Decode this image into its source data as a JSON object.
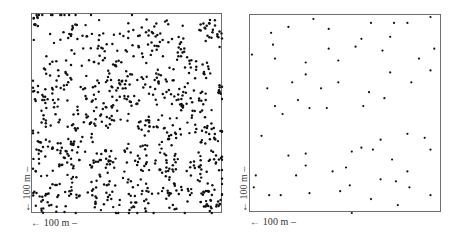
{
  "chart_data": [
    {
      "type": "scatter",
      "title": "",
      "description": "Clustered (aggregated) spatial point pattern in a 100 m x 100 m plot",
      "xlabel": "← 100 m –",
      "ylabel": "← 100 m –",
      "xlim": [
        0,
        100
      ],
      "ylim": [
        0,
        100
      ],
      "grid": false,
      "approx_point_count": 900,
      "clusters": [
        {
          "x": 3,
          "y": 97,
          "r": 4,
          "n": 8
        },
        {
          "x": 22,
          "y": 90,
          "r": 7,
          "n": 12
        },
        {
          "x": 40,
          "y": 78,
          "r": 8,
          "n": 18
        },
        {
          "x": 60,
          "y": 88,
          "r": 10,
          "n": 30
        },
        {
          "x": 76,
          "y": 84,
          "r": 6,
          "n": 14
        },
        {
          "x": 93,
          "y": 92,
          "r": 6,
          "n": 22
        },
        {
          "x": 86,
          "y": 72,
          "r": 7,
          "n": 16
        },
        {
          "x": 14,
          "y": 70,
          "r": 9,
          "n": 22
        },
        {
          "x": 5,
          "y": 60,
          "r": 5,
          "n": 12
        },
        {
          "x": 30,
          "y": 62,
          "r": 6,
          "n": 10
        },
        {
          "x": 50,
          "y": 62,
          "r": 10,
          "n": 34
        },
        {
          "x": 68,
          "y": 64,
          "r": 7,
          "n": 16
        },
        {
          "x": 83,
          "y": 57,
          "r": 8,
          "n": 26
        },
        {
          "x": 98,
          "y": 62,
          "r": 3,
          "n": 8
        },
        {
          "x": 40,
          "y": 50,
          "r": 6,
          "n": 16
        },
        {
          "x": 26,
          "y": 42,
          "r": 9,
          "n": 26
        },
        {
          "x": 10,
          "y": 48,
          "r": 6,
          "n": 12
        },
        {
          "x": 60,
          "y": 44,
          "r": 6,
          "n": 16
        },
        {
          "x": 92,
          "y": 42,
          "r": 7,
          "n": 18
        },
        {
          "x": 74,
          "y": 40,
          "r": 5,
          "n": 10
        },
        {
          "x": 6,
          "y": 33,
          "r": 5,
          "n": 12
        },
        {
          "x": 18,
          "y": 30,
          "r": 8,
          "n": 26
        },
        {
          "x": 36,
          "y": 28,
          "r": 7,
          "n": 22
        },
        {
          "x": 54,
          "y": 28,
          "r": 7,
          "n": 16
        },
        {
          "x": 70,
          "y": 24,
          "r": 6,
          "n": 18
        },
        {
          "x": 86,
          "y": 22,
          "r": 6,
          "n": 14
        },
        {
          "x": 98,
          "y": 28,
          "r": 3,
          "n": 6
        },
        {
          "x": 4,
          "y": 10,
          "r": 4,
          "n": 10
        },
        {
          "x": 16,
          "y": 8,
          "r": 9,
          "n": 22
        },
        {
          "x": 36,
          "y": 12,
          "r": 8,
          "n": 22
        },
        {
          "x": 56,
          "y": 7,
          "r": 8,
          "n": 20
        },
        {
          "x": 75,
          "y": 10,
          "r": 8,
          "n": 22
        },
        {
          "x": 93,
          "y": 7,
          "r": 6,
          "n": 26
        }
      ],
      "background_points": 260,
      "seed": 1337
    },
    {
      "type": "scatter",
      "title": "",
      "description": "Sparse random spatial point pattern in a 100 m x 100 m plot",
      "xlabel": "← 100 m –",
      "ylabel": "← 100 m –",
      "xlim": [
        0,
        100
      ],
      "ylim": [
        0,
        100
      ],
      "grid": false,
      "points": [
        {
          "x": 33,
          "y": 98
        },
        {
          "x": 20,
          "y": 94
        },
        {
          "x": 41,
          "y": 93
        },
        {
          "x": 11,
          "y": 91
        },
        {
          "x": 63,
          "y": 96
        },
        {
          "x": 75,
          "y": 96
        },
        {
          "x": 82,
          "y": 96
        },
        {
          "x": 94,
          "y": 99
        },
        {
          "x": 12,
          "y": 85
        },
        {
          "x": 58,
          "y": 88
        },
        {
          "x": 73,
          "y": 89
        },
        {
          "x": 41,
          "y": 83
        },
        {
          "x": 55,
          "y": 84
        },
        {
          "x": 69,
          "y": 82
        },
        {
          "x": 96,
          "y": 83
        },
        {
          "x": 1,
          "y": 80
        },
        {
          "x": 13,
          "y": 78
        },
        {
          "x": 29,
          "y": 76
        },
        {
          "x": 46,
          "y": 77
        },
        {
          "x": 88,
          "y": 78
        },
        {
          "x": 94,
          "y": 72
        },
        {
          "x": 29,
          "y": 70
        },
        {
          "x": 73,
          "y": 71
        },
        {
          "x": 22,
          "y": 66
        },
        {
          "x": 46,
          "y": 66
        },
        {
          "x": 84,
          "y": 66
        },
        {
          "x": 9,
          "y": 63
        },
        {
          "x": 37,
          "y": 63
        },
        {
          "x": 62,
          "y": 61
        },
        {
          "x": 25,
          "y": 57
        },
        {
          "x": 70,
          "y": 58
        },
        {
          "x": 13,
          "y": 54
        },
        {
          "x": 31,
          "y": 53
        },
        {
          "x": 40,
          "y": 53
        },
        {
          "x": 59,
          "y": 54
        },
        {
          "x": 17,
          "y": 50
        },
        {
          "x": 6,
          "y": 39
        },
        {
          "x": 82,
          "y": 40
        },
        {
          "x": 91,
          "y": 38
        },
        {
          "x": 68,
          "y": 37
        },
        {
          "x": 58,
          "y": 33
        },
        {
          "x": 64,
          "y": 32
        },
        {
          "x": 94,
          "y": 32
        },
        {
          "x": 53,
          "y": 31
        },
        {
          "x": 29,
          "y": 30
        },
        {
          "x": 20,
          "y": 29
        },
        {
          "x": 74,
          "y": 27
        },
        {
          "x": 29,
          "y": 24
        },
        {
          "x": 50,
          "y": 23
        },
        {
          "x": 43,
          "y": 21
        },
        {
          "x": 82,
          "y": 21
        },
        {
          "x": 24,
          "y": 19
        },
        {
          "x": 3,
          "y": 19
        },
        {
          "x": 68,
          "y": 17
        },
        {
          "x": 76,
          "y": 16
        },
        {
          "x": 52,
          "y": 14
        },
        {
          "x": 2,
          "y": 13
        },
        {
          "x": 83,
          "y": 13
        },
        {
          "x": 47,
          "y": 11
        },
        {
          "x": 31,
          "y": 10
        },
        {
          "x": 16,
          "y": 9
        },
        {
          "x": 10,
          "y": 9
        },
        {
          "x": 94,
          "y": 9
        },
        {
          "x": 63,
          "y": 7
        },
        {
          "x": 77,
          "y": 4
        },
        {
          "x": 53,
          "y": 0
        }
      ]
    }
  ],
  "panels": [
    {
      "xlabel": "← 100 m –",
      "ylabel": "← 100 m –"
    },
    {
      "xlabel": "← 100 m –",
      "ylabel": "← 100 m –"
    }
  ],
  "style": {
    "point_color": "#111111",
    "frame_color": "#6e6e6e"
  }
}
